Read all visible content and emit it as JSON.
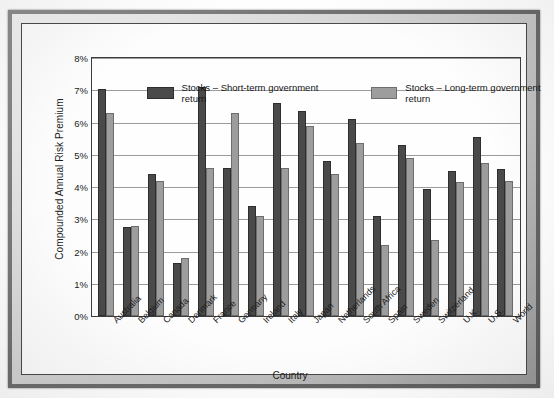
{
  "chart_data": {
    "type": "bar",
    "title": "",
    "xlabel": "Country",
    "ylabel": "Compounded Annual Risk Premium",
    "ylim": [
      0,
      8
    ],
    "ytick_labels": [
      "8%",
      "7%",
      "6%",
      "5%",
      "4%",
      "3%",
      "2%",
      "1%",
      "0%"
    ],
    "ytick_values": [
      8,
      7,
      6,
      5,
      4,
      3,
      2,
      1,
      0
    ],
    "grid": true,
    "legend_position": "top-inside",
    "categories": [
      "Australia",
      "Belgium",
      "Canada",
      "Denmark",
      "France",
      "Germany",
      "Ireland",
      "Italy",
      "Japan",
      "Netherlands",
      "South Africa",
      "Spain",
      "Sweden",
      "Switzerland",
      "U.K.",
      "U.S.",
      "World"
    ],
    "series": [
      {
        "name": "Stocks – Short-term government return",
        "color": "#4a4a4a",
        "values": [
          7.05,
          2.75,
          4.4,
          1.65,
          7.1,
          4.6,
          3.4,
          6.6,
          6.35,
          4.8,
          6.1,
          3.1,
          5.3,
          3.95,
          4.5,
          5.55,
          4.55
        ]
      },
      {
        "name": "Stocks – Long-term government return",
        "color": "#9d9d9d",
        "values": [
          6.3,
          2.8,
          4.2,
          1.8,
          4.6,
          6.3,
          3.1,
          4.6,
          5.9,
          4.4,
          5.35,
          2.2,
          4.9,
          2.35,
          4.15,
          4.75,
          4.2
        ]
      }
    ]
  }
}
